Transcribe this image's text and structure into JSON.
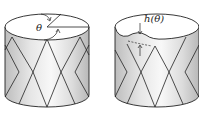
{
  "diagram": {
    "panels": [
      {
        "id": "left",
        "label": "θ",
        "description": "cylinder with angular cut on top face"
      },
      {
        "id": "right",
        "label": "h(θ)",
        "description": "cylinder with deformed top edge of height h(θ)"
      }
    ],
    "colors": {
      "line": "#222222",
      "shade": "#d4d4d4",
      "light": "#f2f2f2"
    }
  }
}
